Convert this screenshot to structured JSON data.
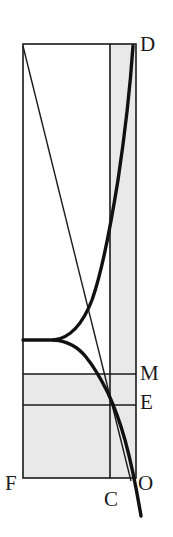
{
  "figure": {
    "kind": "geometric-diagram",
    "width": 173,
    "height": 537,
    "background_color": "#ffffff",
    "shade_color": "#e9e9e9",
    "line_color": "#1a1a1a",
    "curve_color": "#1a1a1a",
    "frame": {
      "left_x": 23,
      "right_x": 136,
      "top_y": 44,
      "bottom_y": 478,
      "inner_vertical_x": 110,
      "horizontal_M_y": 374,
      "horizontal_E_y": 405,
      "curve_asymptote_y": 340
    },
    "labels": [
      {
        "id": "D",
        "text": "D",
        "x": 140,
        "y": 34
      },
      {
        "id": "M",
        "text": "M",
        "x": 140,
        "y": 363
      },
      {
        "id": "E",
        "text": "E",
        "x": 140,
        "y": 392
      },
      {
        "id": "F",
        "text": "F",
        "x": 5,
        "y": 473
      },
      {
        "id": "C",
        "text": "C",
        "x": 104,
        "y": 489
      },
      {
        "id": "O",
        "text": "O",
        "x": 138,
        "y": 473
      }
    ],
    "elements": {
      "outer_rectangle": "rectangle F-D spanning left edge to right edge",
      "inner_vertical_line": "vertical line through C",
      "horizontal_line_M": "horizontal line at level M",
      "horizontal_line_E": "horizontal line at level E",
      "diagonal_line": "straight line from top-left corner to O",
      "upper_curve_branch": "thick curve rising from asymptote to D",
      "lower_curve_branch": "thick curve descending from asymptote through M and E to O and beyond",
      "asymptote_segment": "thick horizontal segment from left edge to curve split"
    },
    "shaded_regions": [
      "right column between inner vertical line and right edge, full height",
      "horizontal band between line M and line E, from left edge to right edge",
      "bottom region from left edge to right edge, between line E and bottom edge"
    ]
  }
}
